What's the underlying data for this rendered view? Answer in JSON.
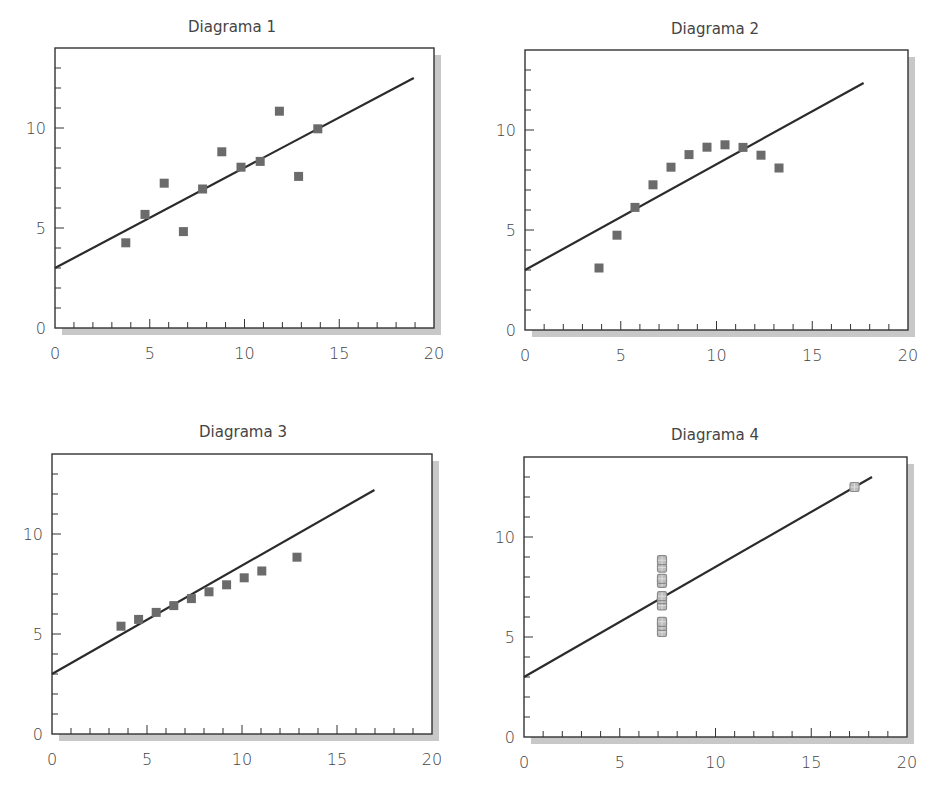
{
  "chart_data": [
    {
      "type": "scatter",
      "title": "Diagrama 1",
      "xlabel": "",
      "ylabel": "",
      "xlim": [
        0,
        20
      ],
      "ylim": [
        0,
        14
      ],
      "xticks": [
        0,
        5,
        10,
        15,
        20
      ],
      "yticks": [
        0,
        5,
        10
      ],
      "grid": false,
      "x": [
        4,
        5,
        6,
        7,
        8,
        9,
        10,
        11,
        12,
        13,
        14
      ],
      "y": [
        4.26,
        5.68,
        7.24,
        4.82,
        6.95,
        8.81,
        8.04,
        8.33,
        10.84,
        7.58,
        9.96
      ],
      "fit_line": {
        "intercept": 3.0,
        "slope": 0.5,
        "x_range": [
          0,
          19
        ]
      }
    },
    {
      "type": "scatter",
      "title": "Diagrama 2",
      "xlabel": "",
      "ylabel": "",
      "xlim": [
        0,
        20
      ],
      "ylim": [
        0,
        14
      ],
      "xticks": [
        0,
        5,
        10,
        15,
        20
      ],
      "yticks": [
        0,
        5,
        10
      ],
      "grid": false,
      "x": [
        4,
        5,
        6,
        7,
        8,
        9,
        10,
        11,
        12,
        13,
        14
      ],
      "y": [
        3.1,
        4.74,
        6.13,
        7.26,
        8.14,
        8.77,
        9.14,
        9.26,
        9.13,
        8.74,
        8.1
      ],
      "fit_line": {
        "intercept": 3.0,
        "slope": 0.5,
        "x_range": [
          0,
          18.7
        ]
      }
    },
    {
      "type": "scatter",
      "title": "Diagrama 3",
      "xlabel": "",
      "ylabel": "",
      "xlim": [
        0,
        20
      ],
      "ylim": [
        0,
        14
      ],
      "xticks": [
        0,
        5,
        10,
        15,
        20
      ],
      "yticks": [
        0,
        5,
        10
      ],
      "grid": false,
      "x": [
        4,
        5,
        6,
        7,
        8,
        9,
        10,
        11,
        12,
        13,
        14
      ],
      "y": [
        5.39,
        5.73,
        6.08,
        6.42,
        6.77,
        7.11,
        7.46,
        7.81,
        8.15,
        8.84,
        12.74
      ],
      "visible_x": [
        4,
        5,
        6,
        7,
        8,
        9,
        10,
        11,
        12,
        14
      ],
      "visible_y": [
        5.39,
        5.73,
        6.08,
        6.42,
        6.77,
        7.11,
        7.46,
        7.81,
        8.15,
        8.84
      ],
      "fit_line": {
        "intercept": 3.0,
        "slope": 0.5,
        "x_range": [
          0,
          18.4
        ]
      }
    },
    {
      "type": "scatter",
      "title": "Diagrama 4",
      "xlabel": "",
      "ylabel": "",
      "xlim": [
        0,
        20
      ],
      "ylim": [
        0,
        14
      ],
      "xticks": [
        0,
        5,
        10,
        15,
        20
      ],
      "yticks": [
        0,
        5,
        10
      ],
      "grid": false,
      "x": [
        8,
        8,
        8,
        8,
        8,
        8,
        8,
        8,
        8,
        8,
        19
      ],
      "y": [
        5.25,
        5.56,
        5.76,
        6.58,
        6.89,
        7.04,
        7.71,
        7.91,
        8.47,
        8.84,
        12.5
      ],
      "fit_line": {
        "intercept": 3.0,
        "slope": 0.5,
        "x_range": [
          0,
          20
        ]
      }
    }
  ],
  "colors": {
    "marker": "#6b6b6b",
    "marker_hollow": "#8a8a8a",
    "axis": "#333333",
    "line": "#2b2b2b",
    "shadow": "#c8c8c8",
    "text": "#444444"
  }
}
